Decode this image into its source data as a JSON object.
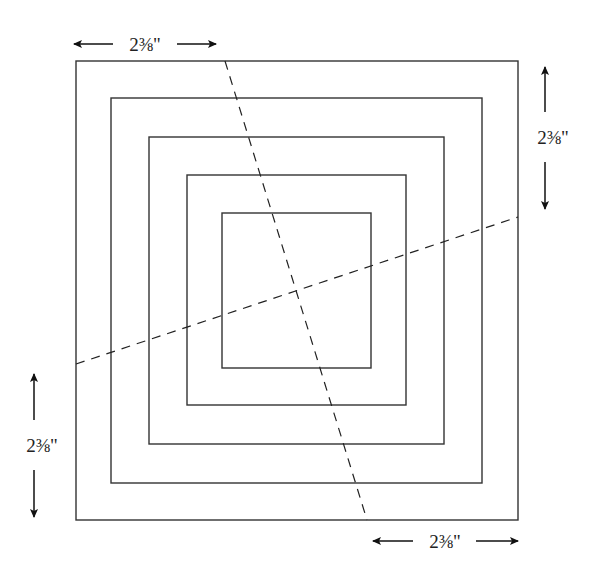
{
  "diagram": {
    "type": "concentric-squares-cutting-guide",
    "squares": [
      {
        "name": "square-1-outer",
        "x": 76,
        "y": 61,
        "w": 442,
        "h": 459
      },
      {
        "name": "square-2",
        "x": 111,
        "y": 98,
        "w": 371,
        "h": 385
      },
      {
        "name": "square-3",
        "x": 149,
        "y": 137,
        "w": 295,
        "h": 307
      },
      {
        "name": "square-4",
        "x": 187,
        "y": 175,
        "w": 219,
        "h": 230
      },
      {
        "name": "square-5-inner",
        "x": 222,
        "y": 213,
        "w": 149,
        "h": 155
      }
    ],
    "cut_lines": [
      {
        "name": "cut-line-steep",
        "x1": 225,
        "y1": 61,
        "x2": 367,
        "y2": 520
      },
      {
        "name": "cut-line-shallow",
        "x1": 76,
        "y1": 364,
        "x2": 518,
        "y2": 217
      }
    ],
    "dimensions": {
      "top": {
        "label": "2⅜\"",
        "orientation": "horizontal"
      },
      "right": {
        "label": "2⅜\"",
        "orientation": "vertical"
      },
      "left": {
        "label": "2⅜\"",
        "orientation": "vertical"
      },
      "bottom": {
        "label": "2⅜\"",
        "orientation": "horizontal"
      }
    },
    "colors": {
      "line": "#333333",
      "background": "#ffffff"
    }
  }
}
